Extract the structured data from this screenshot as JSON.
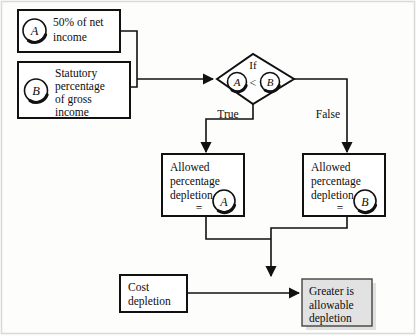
{
  "figure": {
    "type": "flowchart",
    "background_color": "#fdfdfc",
    "line_color": "#111111",
    "shaded_fill": "#e2e2e2"
  },
  "nodes": {
    "input_a": {
      "label_marker": "A",
      "line1": "50% of net",
      "line2": "income",
      "shape": "rectangle"
    },
    "input_b": {
      "label_marker": "B",
      "line1": "Statutory",
      "line2": "percentage",
      "line3": "of gross",
      "line4": "income",
      "shape": "rectangle"
    },
    "decision": {
      "shape": "diamond",
      "keyword": "If",
      "left_marker": "A",
      "operator": "<",
      "right_marker": "B"
    },
    "branch_true": {
      "edge_label": "True",
      "line1": "Allowed",
      "line2": "percentage",
      "line3": "depletion",
      "equals": "=",
      "result_marker": "A",
      "shape": "rectangle"
    },
    "branch_false": {
      "edge_label": "False",
      "line1": "Allowed",
      "line2": "percentage",
      "line3": "depletion",
      "equals": "=",
      "result_marker": "B",
      "shape": "rectangle"
    },
    "cost_depletion": {
      "line1": "Cost",
      "line2": "depletion",
      "shape": "rectangle"
    },
    "result": {
      "line1": "Greater is",
      "line2": "allowable",
      "line3": "depletion",
      "shape": "rectangle-shaded"
    }
  }
}
